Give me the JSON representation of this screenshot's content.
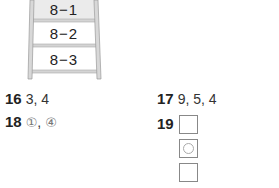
{
  "ladder": {
    "steps": [
      {
        "label": "8−1",
        "highlighted": true
      },
      {
        "label": "8−2",
        "highlighted": false
      },
      {
        "label": "8−3",
        "highlighted": false
      }
    ],
    "colors": {
      "rail": "#c8c8c8",
      "rail_edge": "#999999",
      "highlight_fill": "#ebebeb"
    }
  },
  "answers": {
    "q16": {
      "number": "16",
      "value": "3, 4"
    },
    "q17": {
      "number": "17",
      "value": "9, 5, 4"
    },
    "q18": {
      "number": "18",
      "value_parts": [
        "①",
        ", ",
        "④"
      ]
    },
    "q19": {
      "number": "19",
      "boxes": [
        {
          "mark": "empty"
        },
        {
          "mark": "circle"
        },
        {
          "mark": "empty"
        }
      ]
    }
  }
}
